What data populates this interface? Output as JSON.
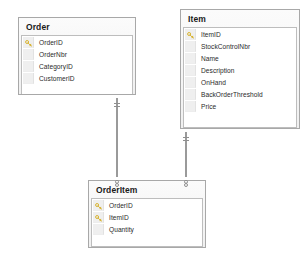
{
  "diagram": {
    "type": "entity-relationship-diagram",
    "background_color": "#ffffff",
    "border_color": "#a8a8a8",
    "key_icon_color": "#d8b433",
    "connector_color": "#9a9a9a"
  },
  "entities": [
    {
      "name": "Order",
      "fields": [
        {
          "name": "OrderID",
          "key": true
        },
        {
          "name": "OrderNbr",
          "key": false
        },
        {
          "name": "CategoryID",
          "key": false
        },
        {
          "name": "CustomerID",
          "key": false
        }
      ]
    },
    {
      "name": "Item",
      "fields": [
        {
          "name": "ItemID",
          "key": true
        },
        {
          "name": "StockControlNbr",
          "key": false
        },
        {
          "name": "Name",
          "key": false
        },
        {
          "name": "Description",
          "key": false
        },
        {
          "name": "OnHand",
          "key": false
        },
        {
          "name": "BackOrderThreshold",
          "key": false
        },
        {
          "name": "Price",
          "key": false
        }
      ]
    },
    {
      "name": "OrderItem",
      "fields": [
        {
          "name": "OrderID",
          "key": true
        },
        {
          "name": "ItemID",
          "key": true
        },
        {
          "name": "Quantity",
          "key": false
        }
      ]
    }
  ],
  "relationships": [
    {
      "from": "Order",
      "to": "OrderItem",
      "from_cardinality": "one",
      "to_cardinality": "many"
    },
    {
      "from": "Item",
      "to": "OrderItem",
      "from_cardinality": "one",
      "to_cardinality": "many"
    }
  ],
  "icons": {
    "key": "key-icon"
  }
}
